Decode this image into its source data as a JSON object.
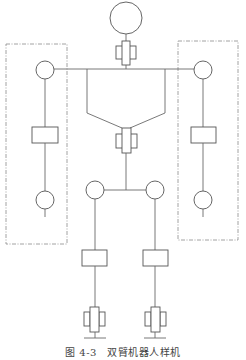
{
  "figure": {
    "caption": "图 4-3　双臂机器人样机",
    "components": {
      "head": "circle-joint",
      "neck": "prismatic-joint",
      "shoulders": [
        "left-revolute-joint",
        "right-revolute-joint"
      ],
      "arms": [
        "left-arm-dashed-group",
        "right-arm-dashed-group"
      ],
      "waist": "prismatic-joint",
      "hips": [
        "left-revolute-joint",
        "right-revolute-joint"
      ],
      "legs": [
        "left-link-block",
        "right-link-block"
      ],
      "feet": [
        "left-prismatic-base",
        "right-prismatic-base"
      ]
    },
    "colors": {
      "line": "#6a6a6a",
      "dash": "#8a8a8a",
      "background": "#ffffff"
    }
  }
}
